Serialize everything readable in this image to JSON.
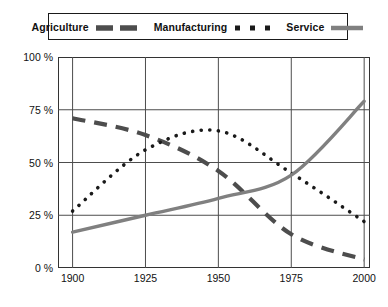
{
  "chart_data": {
    "type": "line",
    "title": "",
    "xlabel": "",
    "ylabel": "",
    "x": [
      1900,
      1925,
      1950,
      1975,
      2000
    ],
    "xlim": [
      1895,
      2002
    ],
    "ylim": [
      0,
      100
    ],
    "grid": true,
    "x_tick_labels": [
      "1900",
      "1925",
      "1950",
      "1975",
      "2000"
    ],
    "y_tick_values": [
      0,
      25,
      50,
      75,
      100
    ],
    "y_tick_labels": [
      "0 %",
      "25 %",
      "50 %",
      "75 %",
      "100 %"
    ],
    "legend_position": "top",
    "series": [
      {
        "name": "Agriculture",
        "style": "dashed",
        "color": "#4d4d4d",
        "width": 4.2,
        "values": [
          71,
          63,
          46,
          16,
          4
        ]
      },
      {
        "name": "Manufacturing",
        "style": "dotted",
        "color": "#1a1a1a",
        "width": 3.6,
        "values": [
          27,
          56,
          65,
          45,
          22
        ]
      },
      {
        "name": "Service",
        "style": "solid",
        "color": "#808080",
        "width": 3.4,
        "values": [
          17,
          25,
          33,
          44,
          79
        ]
      }
    ]
  },
  "legend": {
    "entries": [
      {
        "label": "Agriculture",
        "swatch": "dashed-thick-swatch"
      },
      {
        "label": "Manufacturing",
        "swatch": "dotted-square-swatch"
      },
      {
        "label": "Service",
        "swatch": "solid-gray-swatch"
      }
    ]
  }
}
